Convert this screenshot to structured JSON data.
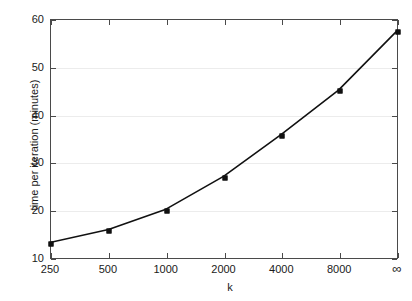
{
  "chart_data": {
    "type": "line",
    "title": "",
    "xlabel": "k",
    "ylabel": "time per iteration (minutes)",
    "categories": [
      "250",
      "500",
      "1000",
      "2000",
      "4000",
      "8000",
      "∞"
    ],
    "values": [
      13.1,
      15.8,
      20.1,
      27.0,
      35.8,
      45.2,
      57.5
    ],
    "series": [
      {
        "name": "time per iteration",
        "values": [
          13.1,
          15.8,
          20.1,
          27.0,
          35.8,
          45.2,
          57.5
        ]
      }
    ],
    "x_tick_labels": [
      "250",
      "500",
      "1000",
      "2000",
      "4000",
      "8000",
      "∞"
    ],
    "y_tick_labels": [
      "10",
      "20",
      "30",
      "40",
      "50",
      "60"
    ],
    "y_tick_values": [
      10,
      20,
      30,
      40,
      50,
      60
    ],
    "ylim": [
      10,
      60
    ],
    "xlim_note": "categorical / log-spaced, evenly placed",
    "grid": "horizontal",
    "legend": "none",
    "marker": "square",
    "line_color": "#111111",
    "marker_color": "#111111",
    "grid_color": "#ececec",
    "axis_color": "#4a4a4a",
    "background": "#ffffff"
  },
  "axes": {
    "x_title": "k",
    "y_title": "time per iteration (minutes)"
  }
}
